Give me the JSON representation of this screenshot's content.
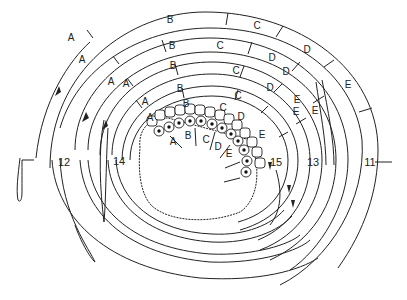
{
  "diagram": {
    "type": "concentric spiral band diagram (cell layer sequence)",
    "bands": [
      {
        "id": "outer",
        "number": "11",
        "segments": [
          "A",
          "B",
          "C",
          "D",
          "E"
        ]
      },
      {
        "id": "band2",
        "number": "12",
        "segments": [
          "A",
          "B",
          "C",
          "D",
          "E"
        ]
      },
      {
        "id": "band3",
        "number": "13",
        "segments": [
          "A",
          "B",
          "C",
          "D",
          "E"
        ]
      },
      {
        "id": "band4",
        "number": "14",
        "segments": [
          "A",
          "B",
          "C",
          "D",
          "E"
        ]
      },
      {
        "id": "inner",
        "number": "15",
        "segments": [
          "A",
          "B",
          "C",
          "D",
          "E"
        ]
      }
    ],
    "cell_layer_labels": [
      "A",
      "B",
      "C",
      "D",
      "E"
    ],
    "numbers": {
      "n11": "11",
      "n12": "12",
      "n13": "13",
      "n14": "14",
      "n15": "15"
    },
    "colors": {
      "line": "#222222",
      "background": "#ffffff"
    }
  }
}
